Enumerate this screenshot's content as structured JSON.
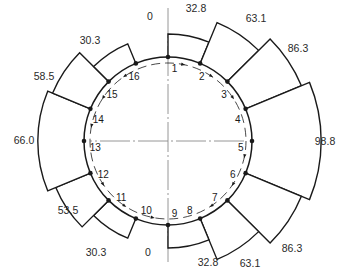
{
  "diagram": {
    "center": [
      168,
      141
    ],
    "ring_radius": 84,
    "dashed_radius": 78,
    "scale_px_per_unit": 0.7,
    "point_count": 16,
    "points": [
      "1",
      "2",
      "3",
      "4",
      "5",
      "6",
      "7",
      "8",
      "9",
      "10",
      "11",
      "12",
      "13",
      "14",
      "15",
      "16"
    ],
    "segments": [
      {
        "from": 1,
        "to": 2,
        "value": 32.8,
        "label": "32.8"
      },
      {
        "from": 2,
        "to": 3,
        "value": 63.1,
        "label": "63.1"
      },
      {
        "from": 3,
        "to": 4,
        "value": 86.3,
        "label": "86.3"
      },
      {
        "from": 4,
        "to": 6,
        "value": 98.8,
        "label": "98.8"
      },
      {
        "from": 6,
        "to": 7,
        "value": 86.3,
        "label": "86.3"
      },
      {
        "from": 7,
        "to": 8,
        "value": 63.1,
        "label": "63.1"
      },
      {
        "from": 8,
        "to": 9,
        "value": 32.8,
        "label": "32.8"
      },
      {
        "from": 9,
        "to": 10,
        "value": 0,
        "label": "0"
      },
      {
        "from": 10,
        "to": 11,
        "value": 30.3,
        "label": "30.3"
      },
      {
        "from": 11,
        "to": 12,
        "value": 53.5,
        "label": "53.5"
      },
      {
        "from": 12,
        "to": 14,
        "value": 66.0,
        "label": "66.0"
      },
      {
        "from": 14,
        "to": 15,
        "value": 58.5,
        "label": "58.5"
      },
      {
        "from": 15,
        "to": 16,
        "value": 30.3,
        "label": "30.3"
      },
      {
        "from": 16,
        "to": 1,
        "value": 0,
        "label": "0"
      }
    ],
    "label_positions": [
      [
        196,
        12
      ],
      [
        256,
        22
      ],
      [
        298,
        52
      ],
      [
        325,
        145
      ],
      [
        292,
        252
      ],
      [
        250,
        267
      ],
      [
        208,
        266
      ],
      [
        148,
        256
      ],
      [
        96,
        256
      ],
      [
        68,
        214
      ],
      [
        24,
        144
      ],
      [
        44,
        80
      ],
      [
        90,
        44
      ],
      [
        150,
        20
      ]
    ],
    "colors": {
      "line": "#1a1a1a",
      "centerline": "#8a8a8a"
    }
  }
}
